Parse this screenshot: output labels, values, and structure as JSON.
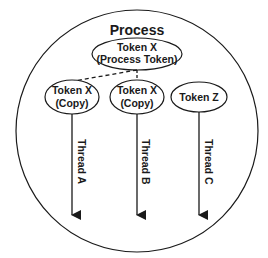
{
  "diagram": {
    "container": {
      "label": "Process"
    },
    "process_token": {
      "line1": "Token X",
      "line2": "(Process Token)"
    },
    "tokens": [
      {
        "line1": "Token X",
        "line2": "(Copy)"
      },
      {
        "line1": "Token X",
        "line2": "(Copy)"
      },
      {
        "line1": "Token Z",
        "line2": ""
      }
    ],
    "threads": [
      {
        "label": "Thread A"
      },
      {
        "label": "Thread B"
      },
      {
        "label": "Thread C"
      }
    ],
    "edges": [
      {
        "from": "process_token",
        "to": "tokens.0",
        "style": "dashed"
      },
      {
        "from": "process_token",
        "to": "tokens.1",
        "style": "dashed"
      }
    ],
    "colors": {
      "stroke": "#1a1a1a",
      "background": "#ffffff"
    }
  }
}
